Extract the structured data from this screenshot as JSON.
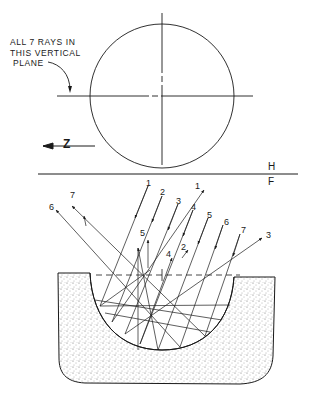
{
  "figure": {
    "annotation": {
      "line1": "ALL 7 RAYS IN",
      "line2": "THIS VERTICAL",
      "line3": "PLANE"
    },
    "direction_label": "Z",
    "plane_labels": {
      "top": "H",
      "bottom": "F"
    },
    "incident_ray_labels": [
      "1",
      "2",
      "3",
      "4",
      "5",
      "6",
      "7"
    ],
    "reflected_ray_labels": [
      "1",
      "2",
      "3",
      "4",
      "5",
      "6",
      "7"
    ],
    "colors": {
      "ink": "#1a1a1a",
      "background": "#ffffff",
      "stipple": "#555555"
    }
  }
}
